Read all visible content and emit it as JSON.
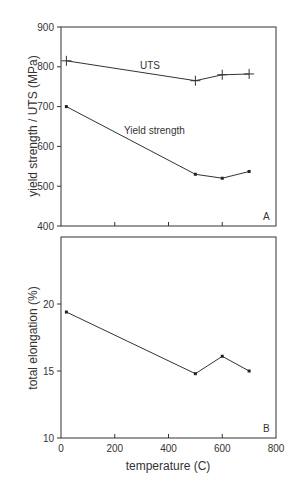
{
  "chart_data": [
    {
      "type": "line",
      "panel_label": "A",
      "title": "",
      "xlabel": "",
      "ylabel": "yield strength / UTS (MPa)",
      "xlim": [
        0,
        800
      ],
      "ylim": [
        400,
        900
      ],
      "x_ticks": [
        0,
        200,
        400,
        600,
        800
      ],
      "y_ticks": [
        400,
        500,
        600,
        700,
        800,
        900
      ],
      "y_tick_labels": [
        "400",
        "500",
        "600",
        "700",
        "800",
        "900"
      ],
      "grid": false,
      "legend": "inline labels",
      "series": [
        {
          "name": "UTS",
          "marker": "plus",
          "x": [
            20,
            500,
            600,
            700
          ],
          "values": [
            815,
            765,
            780,
            782
          ]
        },
        {
          "name": "Yield strength",
          "marker": "dot",
          "x": [
            20,
            500,
            600,
            700
          ],
          "values": [
            700,
            530,
            520,
            537
          ]
        }
      ]
    },
    {
      "type": "line",
      "panel_label": "B",
      "title": "",
      "xlabel": "temperature (C)",
      "ylabel": "total elongation (%)",
      "xlim": [
        0,
        800
      ],
      "ylim": [
        10,
        25
      ],
      "x_ticks": [
        0,
        200,
        400,
        600,
        800
      ],
      "x_tick_labels": [
        "0",
        "200",
        "400",
        "600",
        "800"
      ],
      "y_ticks": [
        10,
        15,
        20
      ],
      "y_tick_labels": [
        "10",
        "15",
        "20"
      ],
      "grid": false,
      "series": [
        {
          "name": "total elongation",
          "marker": "dot",
          "x": [
            20,
            500,
            600,
            700
          ],
          "values": [
            19.4,
            14.8,
            16.1,
            15.0
          ]
        }
      ]
    }
  ],
  "labels": {
    "uts": "UTS",
    "yield": "Yield strength",
    "panel_a": "A",
    "panel_b": "B",
    "ylabel_top": "yield strength / UTS (MPa)",
    "ylabel_bottom": "total elongation (%)",
    "xlabel": "temperature (C)"
  }
}
